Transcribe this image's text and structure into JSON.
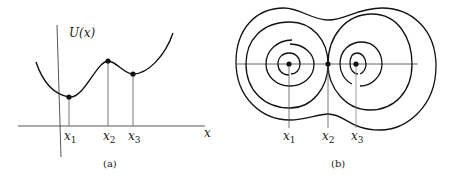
{
  "panel_a": {
    "caption": "(a)",
    "y_axis_label": "U(x)",
    "x_axis_label": "x",
    "points": [
      {
        "name": "x",
        "sub": "1",
        "type": "minimum"
      },
      {
        "name": "x",
        "sub": "2",
        "type": "maximum"
      },
      {
        "name": "x",
        "sub": "3",
        "type": "minimum"
      }
    ]
  },
  "panel_b": {
    "caption": "(b)",
    "points": [
      {
        "name": "x",
        "sub": "1",
        "type": "center"
      },
      {
        "name": "x",
        "sub": "2",
        "type": "saddle"
      },
      {
        "name": "x",
        "sub": "3",
        "type": "center"
      }
    ]
  },
  "colors": {
    "stroke": "#111111",
    "thin_line": "#555555",
    "background": "#ffffff"
  }
}
